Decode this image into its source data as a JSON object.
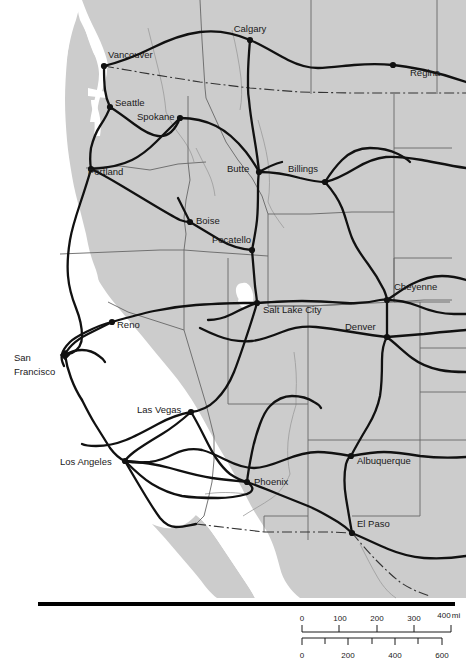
{
  "map": {
    "title": "Western North America Intercity Highway Map",
    "type": "reference-map",
    "colors": {
      "land": "#cccccc",
      "water": "#ffffff",
      "highway": "#111111",
      "border_admin": "#4d4d4d",
      "border_international": "#333333",
      "river": "#999999",
      "label": "#1a1a1a",
      "rule": "#000000"
    },
    "cities": [
      {
        "name": "Calgary",
        "x": 250,
        "y": 32,
        "dot_x": 250,
        "dot_y": 40,
        "anchor": "middle",
        "marker": "dot"
      },
      {
        "name": "Regina",
        "x": 410,
        "y": 76,
        "dot_x": 393,
        "dot_y": 65,
        "anchor": "start",
        "marker": "dot"
      },
      {
        "name": "Vancouver",
        "x": 108,
        "y": 58,
        "dot_x": 104,
        "dot_y": 66,
        "anchor": "start",
        "marker": "dot"
      },
      {
        "name": "Seattle",
        "x": 115,
        "y": 106,
        "dot_x": 110,
        "dot_y": 107,
        "anchor": "start",
        "marker": "dot"
      },
      {
        "name": "Spokane",
        "x": 137,
        "y": 120,
        "dot_x": 180,
        "dot_y": 118,
        "anchor": "start",
        "marker": "dot"
      },
      {
        "name": "Portland",
        "x": 88,
        "y": 175,
        "dot_x": 91,
        "dot_y": 169,
        "anchor": "start",
        "marker": "dot"
      },
      {
        "name": "Butte",
        "x": 227,
        "y": 172,
        "dot_x": 259,
        "dot_y": 172,
        "anchor": "start",
        "marker": "dot"
      },
      {
        "name": "Billings",
        "x": 288,
        "y": 172,
        "dot_x": 325,
        "dot_y": 182,
        "anchor": "start",
        "marker": "dot"
      },
      {
        "name": "Boise",
        "x": 196,
        "y": 224,
        "dot_x": 190,
        "dot_y": 222,
        "anchor": "start",
        "marker": "dot"
      },
      {
        "name": "Pocatello",
        "x": 212,
        "y": 243,
        "dot_x": 252,
        "dot_y": 250,
        "anchor": "start",
        "marker": "dot"
      },
      {
        "name": "Cheyenne",
        "x": 394,
        "y": 290,
        "dot_x": 387,
        "dot_y": 300,
        "anchor": "start",
        "marker": "dot"
      },
      {
        "name": "Salt Lake City",
        "x": 263,
        "y": 313,
        "dot_x": 257,
        "dot_y": 303,
        "anchor": "start",
        "marker": "dot"
      },
      {
        "name": "Denver",
        "x": 345,
        "y": 330,
        "dot_x": 387,
        "dot_y": 337,
        "anchor": "start",
        "marker": "dot"
      },
      {
        "name": "Reno",
        "x": 117,
        "y": 328,
        "dot_x": 112,
        "dot_y": 322,
        "anchor": "start",
        "marker": "dot"
      },
      {
        "name": "San Francisco",
        "x": 14,
        "y": 361,
        "dot_x": 65,
        "dot_y": 355,
        "anchor": "start",
        "marker": "diamond",
        "line2": "Francisco",
        "line2_y": 375
      },
      {
        "name": "Las Vegas",
        "x": 137,
        "y": 413,
        "dot_x": 191,
        "dot_y": 412,
        "anchor": "start",
        "marker": "dot"
      },
      {
        "name": "Los Angeles",
        "x": 60,
        "y": 465,
        "dot_x": 125,
        "dot_y": 461,
        "anchor": "start",
        "marker": "dot"
      },
      {
        "name": "Phoenix",
        "x": 254,
        "y": 485,
        "dot_x": 247,
        "dot_y": 482,
        "anchor": "start",
        "marker": "dot"
      },
      {
        "name": "Albuquerque",
        "x": 357,
        "y": 464,
        "dot_x": 351,
        "dot_y": 456,
        "anchor": "start",
        "marker": "dot"
      },
      {
        "name": "El Paso",
        "x": 357,
        "y": 527,
        "dot_x": 352,
        "dot_y": 533,
        "anchor": "start",
        "marker": "dot"
      }
    ]
  },
  "scale_bar": {
    "miles": {
      "unit": "mi",
      "ticks": [
        {
          "label": "0",
          "value": 0
        },
        {
          "label": "100",
          "value": 100
        },
        {
          "label": "200",
          "value": 200
        },
        {
          "label": "300",
          "value": 300
        },
        {
          "label": "400",
          "value": 400
        }
      ]
    },
    "kilometers": {
      "unit": "",
      "ticks": [
        {
          "label": "0",
          "value": 0
        },
        {
          "label": "200",
          "value": 200
        },
        {
          "label": "400",
          "value": 400
        },
        {
          "label": "600",
          "value": 600
        }
      ]
    }
  }
}
